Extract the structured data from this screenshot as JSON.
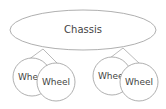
{
  "diagram": {
    "type": "tree",
    "root": {
      "id": "chassis",
      "label": "Chassis",
      "cx": 83,
      "cy": 30,
      "rx": 73,
      "ry": 20
    },
    "junctions": [
      {
        "id": "left",
        "x": 43,
        "y": 49
      },
      {
        "id": "right",
        "x": 123,
        "y": 48
      }
    ],
    "children": [
      {
        "id": "wheel1",
        "label": "Wheel",
        "cx": 32,
        "cy": 77,
        "r": 19,
        "junction": "left"
      },
      {
        "id": "wheel2",
        "label": "Wheel",
        "cx": 56,
        "cy": 82,
        "r": 19,
        "junction": "left"
      },
      {
        "id": "wheel3",
        "label": "Wheel",
        "cx": 112,
        "cy": 76,
        "r": 19,
        "junction": "right"
      },
      {
        "id": "wheel4",
        "label": "Wheel",
        "cx": 139,
        "cy": 82,
        "r": 19,
        "junction": "right"
      }
    ],
    "colors": {
      "stroke": "#9a9a9a",
      "text": "#444444",
      "background": "#ffffff"
    }
  }
}
